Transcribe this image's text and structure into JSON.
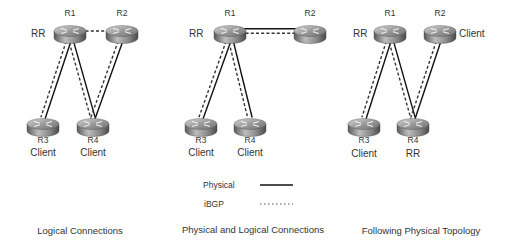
{
  "legend": {
    "physical_label": "Physical",
    "ibgp_label": "iBGP"
  },
  "panels": [
    {
      "caption": "Logical Connections",
      "routers": [
        {
          "id": "R1",
          "role": "RR"
        },
        {
          "id": "R2",
          "role": ""
        },
        {
          "id": "R3",
          "role": "Client"
        },
        {
          "id": "R4",
          "role": "Client"
        }
      ],
      "links": [
        {
          "from": "R1",
          "to": "R3",
          "physical": true,
          "ibgp": true
        },
        {
          "from": "R1",
          "to": "R4",
          "physical": true,
          "ibgp": true
        },
        {
          "from": "R2",
          "to": "R4",
          "physical": true,
          "ibgp": true
        },
        {
          "from": "R1",
          "to": "R2",
          "physical": false,
          "ibgp": true
        }
      ]
    },
    {
      "caption": "Physical and Logical Connections",
      "routers": [
        {
          "id": "R1",
          "role": "RR"
        },
        {
          "id": "R2",
          "role": ""
        },
        {
          "id": "R3",
          "role": "Client"
        },
        {
          "id": "R4",
          "role": "Client"
        }
      ],
      "links": [
        {
          "from": "R1",
          "to": "R3",
          "physical": true,
          "ibgp": true
        },
        {
          "from": "R1",
          "to": "R4",
          "physical": true,
          "ibgp": true
        },
        {
          "from": "R1",
          "to": "R2",
          "physical": true,
          "ibgp": true
        }
      ]
    },
    {
      "caption": "Following Physical Topology",
      "routers": [
        {
          "id": "R1",
          "role": "RR"
        },
        {
          "id": "R2",
          "role": "Client"
        },
        {
          "id": "R3",
          "role": "Client"
        },
        {
          "id": "R4",
          "role": "RR"
        }
      ],
      "links": [
        {
          "from": "R1",
          "to": "R3",
          "physical": true,
          "ibgp": true
        },
        {
          "from": "R1",
          "to": "R4",
          "physical": true,
          "ibgp": true
        },
        {
          "from": "R2",
          "to": "R4",
          "physical": true,
          "ibgp": true
        }
      ]
    }
  ]
}
